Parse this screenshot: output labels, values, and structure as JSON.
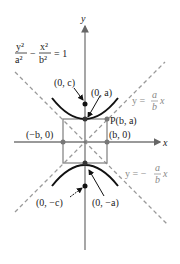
{
  "equation": {
    "lhs_num1": "y²",
    "lhs_den1": "a²",
    "minus": "−",
    "lhs_num2": "x²",
    "lhs_den2": "b²",
    "rhs": "= 1"
  },
  "axes": {
    "x_label": "x",
    "y_label": "y"
  },
  "points": {
    "focus_top": "(0, c)",
    "vertex_top": "(0, a)",
    "corner": "P(b, a)",
    "left": "(−b, 0)",
    "right": "(b, 0)",
    "focus_bottom": "(0, −c)",
    "vertex_bottom": "(0, −a)"
  },
  "asymptotes": {
    "pos": {
      "prefix": "y =",
      "num": "a",
      "den": "b",
      "suffix": "x"
    },
    "neg": {
      "prefix": "y = −",
      "num": "a",
      "den": "b",
      "suffix": "x"
    }
  },
  "colors": {
    "curve": "#111111",
    "axis": "#777777",
    "asymptote": "#999999",
    "box": "#888888"
  }
}
